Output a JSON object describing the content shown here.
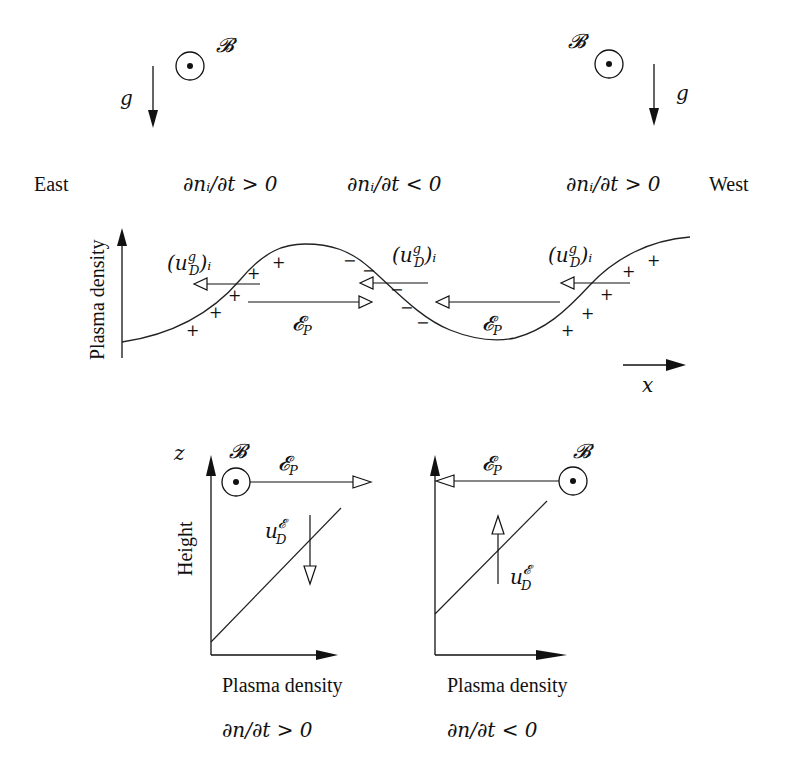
{
  "figure": {
    "top": {
      "left_field": {
        "b_label": "𝓑",
        "g_label": "g",
        "b_symbol": "out-of-page-dot"
      },
      "right_field": {
        "b_label": "𝓑",
        "g_label": "g",
        "b_symbol": "out-of-page-dot"
      },
      "direction_left": "East",
      "direction_right": "West",
      "rate_labels": [
        "∂nᵢ/∂t > 0",
        "∂nᵢ/∂t < 0",
        "∂nᵢ/∂t > 0"
      ],
      "y_axis_label": "Plasma density",
      "x_axis_label": "x",
      "drift_label": "(u",
      "drift_sup": "g",
      "drift_sub": "D",
      "drift_tail": ")ᵢ",
      "field_label": "𝓔",
      "field_sub": "P",
      "charge_plus": "+",
      "charge_minus": "−"
    },
    "bottom_left": {
      "z_label": "z",
      "y_axis_label": "Height",
      "x_axis_label": "Plasma density",
      "b_label": "𝓑",
      "field_label": "𝓔",
      "field_sub": "P",
      "drift_label": "u",
      "drift_sup": "𝓔",
      "drift_sub": "D",
      "caption": "∂n/∂t > 0"
    },
    "bottom_right": {
      "y_axis_label": "",
      "x_axis_label": "Plasma density",
      "b_label": "𝓑",
      "field_label": "𝓔",
      "field_sub": "P",
      "drift_label": "u",
      "drift_sup": "𝓔",
      "drift_sub": "D",
      "caption": "∂n/∂t < 0"
    }
  }
}
